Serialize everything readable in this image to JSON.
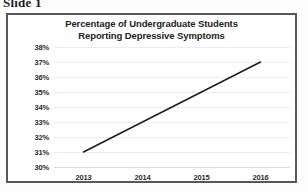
{
  "slide": {
    "caption": "Slide 1"
  },
  "chart_data": {
    "type": "line",
    "title": "Percentage of Undergraduate Students Reporting Depressive Symptoms",
    "title_line1": "Percentage of Undergraduate Students",
    "title_line2": "Reporting Depressive Symptoms",
    "xlabel": "",
    "ylabel": "",
    "categories": [
      "2013",
      "2014",
      "2015",
      "2016"
    ],
    "x": [
      2013,
      2014,
      2015,
      2016
    ],
    "values": [
      31,
      33,
      35,
      37
    ],
    "series": [
      {
        "name": "Percentage Reporting Depressive Symptoms",
        "values": [
          31,
          33,
          35,
          37
        ]
      }
    ],
    "ylim": [
      30,
      38
    ],
    "ytick_values": [
      38,
      37,
      36,
      35,
      34,
      33,
      32,
      31,
      30
    ],
    "ytick_labels": [
      "38%",
      "37%",
      "36%",
      "35%",
      "34%",
      "33%",
      "32%",
      "31%",
      "30%"
    ],
    "xtick_labels": [
      "2013",
      "2014",
      "2015",
      "2016"
    ],
    "grid": true,
    "grid_axis": "y",
    "legend": false,
    "legend_position": "none",
    "line_color": "#1f1f1f",
    "grid_color": "#ececec",
    "plot_background": "#ffffff",
    "frame_color": "#585858",
    "text_color": "#232323"
  }
}
